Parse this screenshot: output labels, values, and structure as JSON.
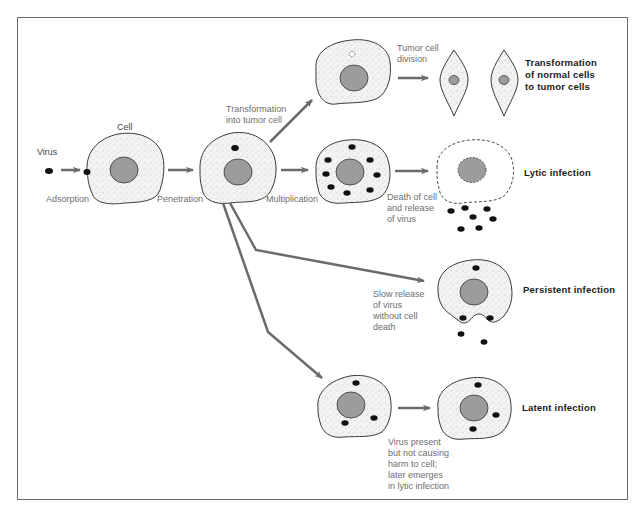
{
  "diagram": {
    "type": "virus-cell interaction pathways",
    "colors": {
      "frame": "#6a6a6a",
      "arrow": "#6b6b6b",
      "cell_fill": "#f2f2f2",
      "cell_outline": "#3a3a3a",
      "nucleus": "#9c9c9c",
      "virus": "#111111",
      "label_text": "#6e6e6e",
      "outcome_text": "#1a1a1a"
    },
    "labels": {
      "virus": "Virus",
      "cell": "Cell",
      "adsorption": "Adsorption",
      "penetration": "Penetration",
      "multiplication": "Multiplication",
      "transformation_into_tumor": "Transformation\ninto tumor cell",
      "tumor_division": "Tumor cell\ndivision",
      "death_release": "Death of cell\nand release\nof virus",
      "slow_release": "Slow release\nof virus\nwithout cell\ndeath",
      "virus_present": "Virus present\nbut not causing\nharm to cell;\nlater emerges\nin lytic infection"
    },
    "outcomes": {
      "transformation": "Transformation\nof normal cells\nto tumor cells",
      "lytic": "Lytic infection",
      "persistent": "Persistent infection",
      "latent": "Latent infection"
    }
  }
}
